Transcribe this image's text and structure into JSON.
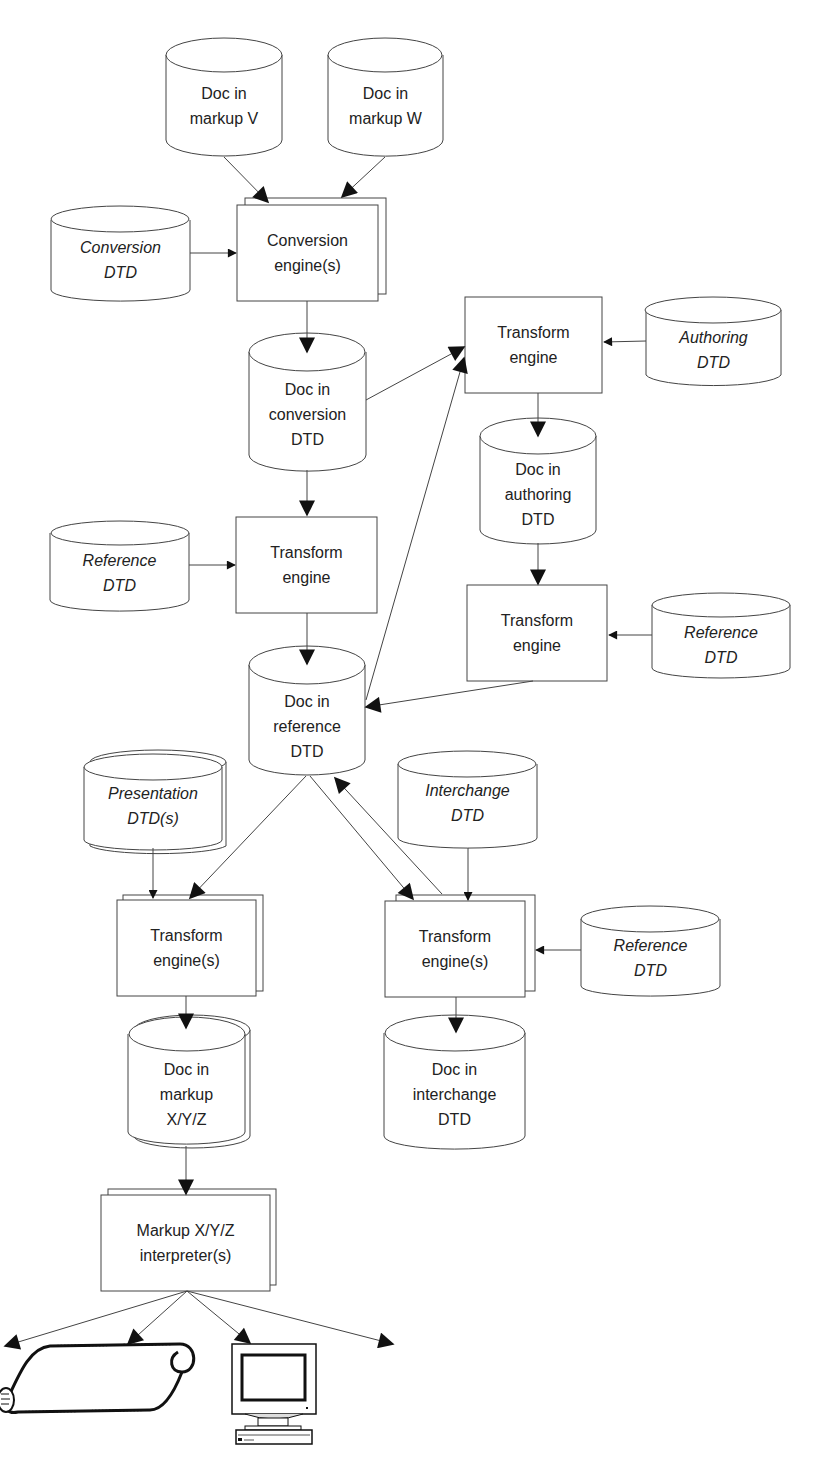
{
  "diagram": {
    "nodes": {
      "doc_markup_v": {
        "label": "Doc in\nmarkup V",
        "shape": "cylinder"
      },
      "doc_markup_w": {
        "label": "Doc in\nmarkup W",
        "shape": "cylinder"
      },
      "conversion_dtd": {
        "label": "Conversion\nDTD",
        "shape": "cylinder",
        "italic": true
      },
      "conversion_engine": {
        "label": "Conversion\nengine(s)",
        "shape": "stacked-box"
      },
      "doc_conversion_dtd": {
        "label": "Doc in\nconversion\nDTD",
        "shape": "cylinder"
      },
      "transform_engine_authoring": {
        "label": "Transform\nengine",
        "shape": "box"
      },
      "authoring_dtd": {
        "label": "Authoring\nDTD",
        "shape": "cylinder",
        "italic": true
      },
      "doc_authoring_dtd": {
        "label": "Doc in\nauthoring\nDTD",
        "shape": "cylinder"
      },
      "reference_dtd_1": {
        "label": "Reference\nDTD",
        "shape": "cylinder",
        "italic": true
      },
      "transform_engine_reference": {
        "label": "Transform\nengine",
        "shape": "box"
      },
      "transform_engine_authoring_to_ref": {
        "label": "Transform\nengine",
        "shape": "box"
      },
      "reference_dtd_2": {
        "label": "Reference\nDTD",
        "shape": "cylinder",
        "italic": true
      },
      "doc_reference_dtd": {
        "label": "Doc in\nreference\nDTD",
        "shape": "cylinder"
      },
      "presentation_dtds": {
        "label": "Presentation\nDTD(s)",
        "shape": "stacked-cylinder",
        "italic": true
      },
      "interchange_dtd": {
        "label": "Interchange\nDTD",
        "shape": "cylinder",
        "italic": true
      },
      "transform_engines_presentation": {
        "label": "Transform\nengine(s)",
        "shape": "stacked-box"
      },
      "transform_engines_interchange": {
        "label": "Transform\nengine(s)",
        "shape": "stacked-box"
      },
      "reference_dtd_3": {
        "label": "Reference\nDTD",
        "shape": "cylinder",
        "italic": true
      },
      "doc_markup_xyz": {
        "label": "Doc in\nmarkup\nX/Y/Z",
        "shape": "stacked-cylinder"
      },
      "doc_interchange_dtd": {
        "label": "Doc in\ninterchange\nDTD",
        "shape": "cylinder"
      },
      "markup_interpreter": {
        "label": "Markup X/Y/Z\ninterpreter(s)",
        "shape": "stacked-box"
      }
    },
    "output_icons": [
      "printed-scroll-icon",
      "computer-monitor-icon"
    ],
    "edges": [
      [
        "doc_markup_v",
        "conversion_engine"
      ],
      [
        "doc_markup_w",
        "conversion_engine"
      ],
      [
        "conversion_dtd",
        "conversion_engine"
      ],
      [
        "conversion_engine",
        "doc_conversion_dtd"
      ],
      [
        "doc_conversion_dtd",
        "transform_engine_authoring"
      ],
      [
        "doc_conversion_dtd",
        "transform_engine_reference"
      ],
      [
        "authoring_dtd",
        "transform_engine_authoring"
      ],
      [
        "transform_engine_authoring",
        "doc_authoring_dtd"
      ],
      [
        "doc_authoring_dtd",
        "transform_engine_authoring_to_ref"
      ],
      [
        "reference_dtd_2",
        "transform_engine_authoring_to_ref"
      ],
      [
        "transform_engine_authoring_to_ref",
        "doc_reference_dtd"
      ],
      [
        "reference_dtd_1",
        "transform_engine_reference"
      ],
      [
        "transform_engine_reference",
        "doc_reference_dtd"
      ],
      [
        "doc_reference_dtd",
        "transform_engine_authoring"
      ],
      [
        "doc_reference_dtd",
        "transform_engines_presentation"
      ],
      [
        "doc_reference_dtd",
        "transform_engines_interchange"
      ],
      [
        "transform_engines_interchange",
        "doc_reference_dtd"
      ],
      [
        "presentation_dtds",
        "transform_engines_presentation"
      ],
      [
        "interchange_dtd",
        "transform_engines_interchange"
      ],
      [
        "reference_dtd_3",
        "transform_engines_interchange"
      ],
      [
        "transform_engines_presentation",
        "doc_markup_xyz"
      ],
      [
        "transform_engines_interchange",
        "doc_interchange_dtd"
      ],
      [
        "doc_markup_xyz",
        "markup_interpreter"
      ],
      [
        "markup_interpreter",
        "output_left_offscreen"
      ],
      [
        "markup_interpreter",
        "printed-scroll-icon"
      ],
      [
        "markup_interpreter",
        "computer-monitor-icon"
      ],
      [
        "markup_interpreter",
        "output_right"
      ]
    ]
  }
}
